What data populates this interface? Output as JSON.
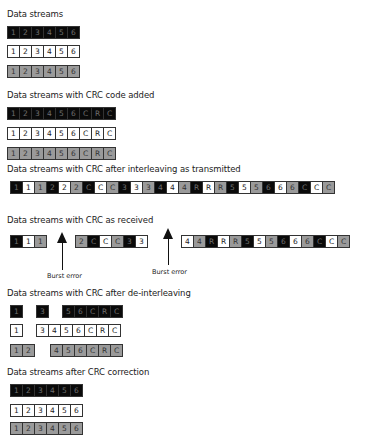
{
  "sections": {
    "original": {
      "title": "Data streams",
      "rows": [
        {
          "color": "k",
          "cells": [
            "1",
            "2",
            "3",
            "4",
            "5",
            "6"
          ]
        },
        {
          "color": "w",
          "cells": [
            "1",
            "2",
            "3",
            "4",
            "5",
            "6"
          ]
        },
        {
          "color": "g",
          "cells": [
            "1",
            "2",
            "3",
            "4",
            "5",
            "6"
          ]
        }
      ]
    },
    "crc_added": {
      "title": "Data streams with CRC code added",
      "rows": [
        {
          "color": "k",
          "cells": [
            "1",
            "2",
            "3",
            "4",
            "5",
            "6",
            "C",
            "R",
            "C"
          ]
        },
        {
          "color": "w",
          "cells": [
            "1",
            "2",
            "3",
            "4",
            "5",
            "6",
            "C",
            "R",
            "C"
          ]
        },
        {
          "color": "g",
          "cells": [
            "1",
            "2",
            "3",
            "4",
            "5",
            "6",
            "C",
            "R",
            "C"
          ]
        }
      ]
    },
    "transmitted": {
      "title": "Data streams with CRC after interleaving as transmitted",
      "cells": [
        {
          "c": "k",
          "t": "1"
        },
        {
          "c": "w",
          "t": "1"
        },
        {
          "c": "g",
          "t": "1"
        },
        {
          "c": "k",
          "t": "2"
        },
        {
          "c": "w",
          "t": "2"
        },
        {
          "c": "g",
          "t": "2"
        },
        {
          "c": "k",
          "t": "C"
        },
        {
          "c": "w",
          "t": "C"
        },
        {
          "c": "g",
          "t": "C"
        },
        {
          "c": "k",
          "t": "3"
        },
        {
          "c": "w",
          "t": "3"
        },
        {
          "c": "g",
          "t": "3"
        },
        {
          "c": "k",
          "t": "4"
        },
        {
          "c": "w",
          "t": "4"
        },
        {
          "c": "g",
          "t": "4"
        },
        {
          "c": "k",
          "t": "R"
        },
        {
          "c": "w",
          "t": "R"
        },
        {
          "c": "g",
          "t": "R"
        },
        {
          "c": "k",
          "t": "5"
        },
        {
          "c": "w",
          "t": "5"
        },
        {
          "c": "g",
          "t": "5"
        },
        {
          "c": "k",
          "t": "6"
        },
        {
          "c": "w",
          "t": "6"
        },
        {
          "c": "g",
          "t": "6"
        },
        {
          "c": "k",
          "t": "C"
        },
        {
          "c": "w",
          "t": "C"
        },
        {
          "c": "g",
          "t": "C"
        }
      ]
    },
    "received": {
      "title": "Data streams with CRC as received",
      "groups": [
        {
          "x": 10,
          "cells": [
            {
              "c": "k",
              "t": "1"
            },
            {
              "c": "w",
              "t": "1"
            },
            {
              "c": "g",
              "t": "1"
            }
          ]
        },
        {
          "x": 75,
          "cells": [
            {
              "c": "g",
              "t": "2"
            },
            {
              "c": "k",
              "t": "C"
            },
            {
              "c": "w",
              "t": "C"
            },
            {
              "c": "g",
              "t": "C"
            },
            {
              "c": "k",
              "t": "3"
            },
            {
              "c": "w",
              "t": "3"
            }
          ]
        },
        {
          "x": 181,
          "cells": [
            {
              "c": "w",
              "t": "4"
            },
            {
              "c": "g",
              "t": "4"
            },
            {
              "c": "k",
              "t": "R"
            },
            {
              "c": "w",
              "t": "R"
            },
            {
              "c": "g",
              "t": "R"
            },
            {
              "c": "k",
              "t": "5"
            },
            {
              "c": "w",
              "t": "5"
            },
            {
              "c": "g",
              "t": "5"
            },
            {
              "c": "k",
              "t": "6"
            },
            {
              "c": "w",
              "t": "6"
            },
            {
              "c": "g",
              "t": "6"
            },
            {
              "c": "k",
              "t": "C"
            },
            {
              "c": "w",
              "t": "C"
            },
            {
              "c": "g",
              "t": "C"
            }
          ]
        }
      ],
      "burst_errors": [
        {
          "label": "Burst error",
          "arrow_x": 62,
          "label_x": 47,
          "top": 232,
          "bottom": 270,
          "label_y": 272
        },
        {
          "label": "Burst error",
          "arrow_x": 168,
          "label_x": 152,
          "top": 228,
          "bottom": 265,
          "label_y": 268
        }
      ]
    },
    "deinterleaved": {
      "title": "Data streams with CRC after de-interleaving",
      "rows": [
        {
          "color": "k",
          "y": 305,
          "groups": [
            {
              "x": 10,
              "cells": [
                "1"
              ]
            },
            {
              "x": 36,
              "cells": [
                "3"
              ]
            },
            {
              "x": 62,
              "cells": [
                "5",
                "6",
                "C",
                "R",
                "C"
              ]
            }
          ]
        },
        {
          "color": "w",
          "y": 324,
          "groups": [
            {
              "x": 10,
              "cells": [
                "1"
              ]
            },
            {
              "x": 36,
              "cells": [
                "3",
                "4",
                "5",
                "6",
                "C",
                "R",
                "C"
              ]
            }
          ]
        },
        {
          "color": "g",
          "y": 344,
          "groups": [
            {
              "x": 10,
              "cells": [
                "1",
                "2"
              ]
            },
            {
              "x": 50,
              "cells": [
                "4",
                "5",
                "6",
                "C",
                "R",
                "C"
              ]
            }
          ]
        }
      ]
    },
    "corrected": {
      "title": "Data streams after CRC correction",
      "rows": [
        {
          "color": "k",
          "cells": [
            "1",
            "2",
            "3",
            "4",
            "5",
            "6"
          ]
        },
        {
          "color": "w",
          "cells": [
            "1",
            "2",
            "3",
            "4",
            "5",
            "6"
          ]
        },
        {
          "color": "g",
          "cells": [
            "1",
            "2",
            "3",
            "4",
            "5",
            "6"
          ]
        }
      ]
    }
  },
  "colors": {
    "black": "#0a0a0a",
    "white": "#ffffff",
    "gray": "#9a9a9a",
    "border": "#333333"
  }
}
